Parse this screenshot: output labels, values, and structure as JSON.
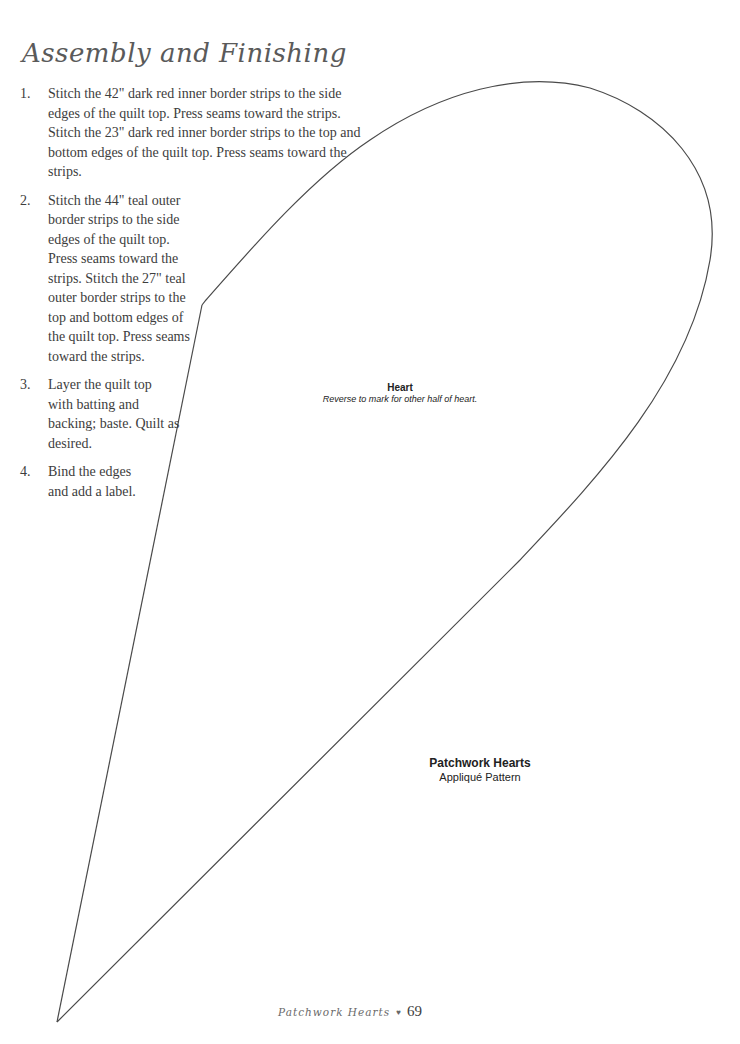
{
  "section": {
    "title": "Assembly and Finishing"
  },
  "steps": [
    {
      "number": "1.",
      "text": "Stitch the 42\" dark red inner border strips to the side edges of the quilt top. Press seams toward the strips. Stitch the 23\" dark red inner border strips to the top and bottom edges of the quilt top. Press seams toward the strips."
    },
    {
      "number": "2.",
      "text": "Stitch the 44\" teal outer border strips to the side edges of the quilt top. Press seams toward the strips. Stitch the 27\" teal outer border strips to the top and bottom edges of the quilt top. Press seams toward the strips."
    },
    {
      "number": "3.",
      "text": "Layer the quilt top with batting and backing; baste. Quilt as desired."
    },
    {
      "number": "4.",
      "text": "Bind the edges and add a label."
    }
  ],
  "pattern": {
    "piece_name": "Heart",
    "piece_note": "Reverse to mark for other half of heart.",
    "title": "Patchwork Hearts",
    "subtitle": "Appliqué Pattern"
  },
  "footer": {
    "book_title": "Patchwork Hearts",
    "bullet": "♥",
    "page_number": "69"
  }
}
